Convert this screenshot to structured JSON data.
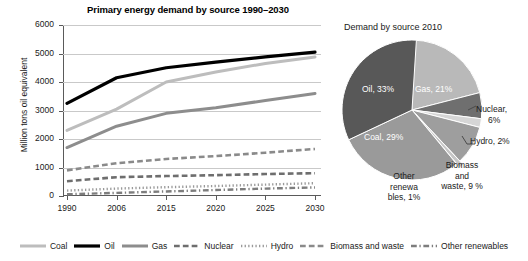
{
  "chart_data": [
    {
      "type": "line",
      "title": "Primary energy demand by source 1990–2030",
      "xlabel": "",
      "ylabel": "Million tons oil equivalent",
      "categories": [
        "1990",
        "2006",
        "2015",
        "2020",
        "2025",
        "2030"
      ],
      "yticks": [
        0,
        1000,
        2000,
        3000,
        4000,
        5000,
        6000
      ],
      "ylim": [
        0,
        6000
      ],
      "grid": true,
      "legend_position": "bottom",
      "series": [
        {
          "name": "Coal",
          "values": [
            2300,
            3050,
            4000,
            4350,
            4650,
            4880
          ],
          "color": "#bdbdbd",
          "style": "solid",
          "width": 3
        },
        {
          "name": "Oil",
          "values": [
            3250,
            4150,
            4500,
            4700,
            4880,
            5050
          ],
          "color": "#000000",
          "style": "solid",
          "width": 3.2
        },
        {
          "name": "Gas",
          "values": [
            1700,
            2450,
            2900,
            3100,
            3350,
            3600
          ],
          "color": "#8d8d8d",
          "style": "solid",
          "width": 3
        },
        {
          "name": "Nuclear",
          "values": [
            520,
            660,
            700,
            730,
            770,
            800
          ],
          "color": "#6e6e6e",
          "style": "dashed",
          "width": 2.6
        },
        {
          "name": "Hydro",
          "values": [
            190,
            260,
            310,
            350,
            400,
            450
          ],
          "color": "#9a9a9a",
          "style": "dotted",
          "width": 2.4
        },
        {
          "name": "Biomass and waste",
          "values": [
            900,
            1150,
            1300,
            1400,
            1520,
            1650
          ],
          "color": "#8a8a8a",
          "style": "dashed",
          "width": 2.6
        },
        {
          "name": "Other renewables",
          "values": [
            60,
            110,
            160,
            210,
            260,
            300
          ],
          "color": "#7d7d7d",
          "style": "dashdot",
          "width": 2.4
        }
      ]
    },
    {
      "type": "pie",
      "title": "Demand by source 2010",
      "labels": [
        "Gas",
        "Nuclear",
        "Hydro",
        "Biomass and waste",
        "Other renewables",
        "Coal",
        "Oil"
      ],
      "values": [
        21,
        6,
        2,
        9,
        1,
        29,
        33
      ],
      "label_texts": [
        "Gas, 21%",
        "Nuclear, 6%",
        "Hydro, 2%",
        "Biomass and waste, 9 %",
        "Other renewa bles, 1%",
        "Coal, 29%",
        "Oil, 33%"
      ],
      "colors": [
        "#b9b9b9",
        "#6f6f6f",
        "#d6d6d6",
        "#9e9e9e",
        "#c6c6c6",
        "#9a9a9a",
        "#585858"
      ]
    }
  ],
  "line_chart": {
    "title": "Primary energy demand by source 1990–2030",
    "ylabel": "Million tons oil equivalent",
    "yticks": [
      "6000",
      "5000",
      "4000",
      "3000",
      "2000",
      "1000",
      "0"
    ],
    "xticks": [
      "1990",
      "2006",
      "2015",
      "2020",
      "2025",
      "2030"
    ]
  },
  "pie_chart": {
    "title": "Demand by source 2010",
    "inner_labels": {
      "oil": "Oil, 33%",
      "gas": "Gas, 21%",
      "coal": "Coal, 29%"
    },
    "outer_labels": {
      "nuclear_line1": "Nuclear,",
      "nuclear_line2": "6%",
      "hydro": "Hydro, 2%",
      "biomass_line1": "Biomass",
      "biomass_line2": "and",
      "biomass_line3": "waste, 9 %",
      "other_line1": "Other",
      "other_line2": "renewa",
      "other_line3": "bles, 1%"
    }
  },
  "legend": {
    "items": [
      {
        "label": "Coal"
      },
      {
        "label": "Oil"
      },
      {
        "label": "Gas"
      },
      {
        "label": "Nuclear"
      },
      {
        "label": "Hydro"
      },
      {
        "label": "Biomass and waste"
      },
      {
        "label": "Other renewables"
      }
    ]
  }
}
